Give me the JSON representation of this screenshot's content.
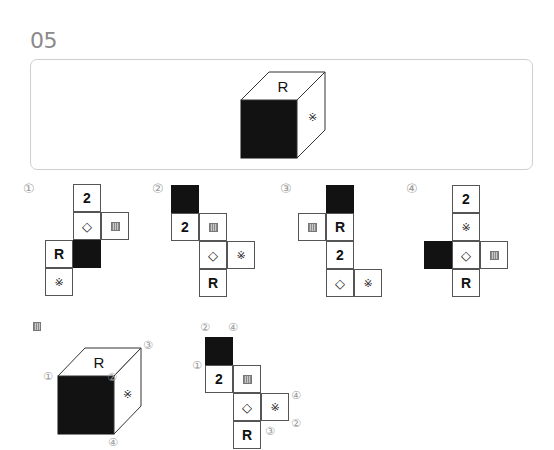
{
  "question": {
    "number": "05",
    "cube": {
      "top": "R",
      "front": "black",
      "right": "※"
    }
  },
  "symbols": {
    "kome": "※",
    "diamond": "◇",
    "stripe": "striped-square"
  },
  "options": [
    {
      "label": "①",
      "cells": [
        {
          "col": 1,
          "row": 0,
          "content": "2"
        },
        {
          "col": 1,
          "row": 1,
          "content": "◇"
        },
        {
          "col": 2,
          "row": 1,
          "content": "stripe"
        },
        {
          "col": 0,
          "row": 2,
          "content": "R"
        },
        {
          "col": 1,
          "row": 2,
          "content": "black"
        },
        {
          "col": 0,
          "row": 3,
          "content": "※"
        }
      ]
    },
    {
      "label": "②",
      "cells": [
        {
          "col": 0,
          "row": 0,
          "content": "black"
        },
        {
          "col": 0,
          "row": 1,
          "content": "2"
        },
        {
          "col": 1,
          "row": 1,
          "content": "stripe"
        },
        {
          "col": 1,
          "row": 2,
          "content": "◇"
        },
        {
          "col": 2,
          "row": 2,
          "content": "※"
        },
        {
          "col": 1,
          "row": 3,
          "content": "R"
        }
      ]
    },
    {
      "label": "③",
      "cells": [
        {
          "col": 1,
          "row": 0,
          "content": "black"
        },
        {
          "col": 0,
          "row": 1,
          "content": "stripe"
        },
        {
          "col": 1,
          "row": 1,
          "content": "R"
        },
        {
          "col": 1,
          "row": 2,
          "content": "2"
        },
        {
          "col": 1,
          "row": 3,
          "content": "◇"
        },
        {
          "col": 2,
          "row": 3,
          "content": "※"
        }
      ]
    },
    {
      "label": "④",
      "cells": [
        {
          "col": 1,
          "row": 0,
          "content": "2"
        },
        {
          "col": 1,
          "row": 1,
          "content": "※"
        },
        {
          "col": 0,
          "row": 2,
          "content": "black"
        },
        {
          "col": 1,
          "row": 2,
          "content": "◇"
        },
        {
          "col": 2,
          "row": 2,
          "content": "stripe"
        },
        {
          "col": 1,
          "row": 3,
          "content": "R"
        }
      ]
    }
  ],
  "solution": {
    "marker": "stripe",
    "cube": {
      "top": "R",
      "front": "black",
      "right": "※",
      "vertex_labels": [
        "①",
        "②",
        "③",
        "④"
      ]
    },
    "net": {
      "cells": [
        {
          "col": 0,
          "row": 0,
          "content": "black"
        },
        {
          "col": 0,
          "row": 1,
          "content": "2"
        },
        {
          "col": 1,
          "row": 1,
          "content": "stripe"
        },
        {
          "col": 1,
          "row": 2,
          "content": "◇"
        },
        {
          "col": 2,
          "row": 2,
          "content": "※"
        },
        {
          "col": 1,
          "row": 3,
          "content": "R"
        }
      ],
      "vertex_labels": {
        "top_left": "②",
        "top_right": "④",
        "left": "①",
        "right_upper": "④",
        "right_lower": "②",
        "bottom": "③"
      }
    }
  }
}
